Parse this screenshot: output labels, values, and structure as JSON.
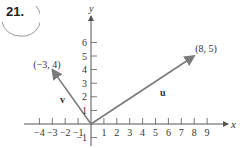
{
  "problem": {
    "number": "21."
  },
  "axes": {
    "x_label": "x",
    "y_label": "y",
    "x_ticks": [
      {
        "label": "−4",
        "value": -4
      },
      {
        "label": "−3",
        "value": -3
      },
      {
        "label": "−2",
        "value": -2
      },
      {
        "label": "−1",
        "value": -1
      },
      {
        "label": "1",
        "value": 1
      },
      {
        "label": "2",
        "value": 2
      },
      {
        "label": "3",
        "value": 3
      },
      {
        "label": "4",
        "value": 4
      },
      {
        "label": "5",
        "value": 5
      },
      {
        "label": "6",
        "value": 6
      },
      {
        "label": "7",
        "value": 7
      },
      {
        "label": "8",
        "value": 8
      },
      {
        "label": "9",
        "value": 9
      }
    ],
    "y_ticks": [
      {
        "label": "−1",
        "value": -1
      },
      {
        "label": "1",
        "value": 1
      },
      {
        "label": "2",
        "value": 2
      },
      {
        "label": "3",
        "value": 3
      },
      {
        "label": "4",
        "value": 4
      },
      {
        "label": "5",
        "value": 5
      },
      {
        "label": "6",
        "value": 6
      }
    ]
  },
  "vectors": [
    {
      "name": "u",
      "end": [
        8,
        5
      ],
      "end_label": "(8, 5)"
    },
    {
      "name": "v",
      "end": [
        -3,
        4
      ],
      "end_label": "(−3, 4)"
    }
  ],
  "colors": {
    "axis": "#555555",
    "vector": "#7a7a7a",
    "badge": "#999999",
    "text": "#333333"
  }
}
